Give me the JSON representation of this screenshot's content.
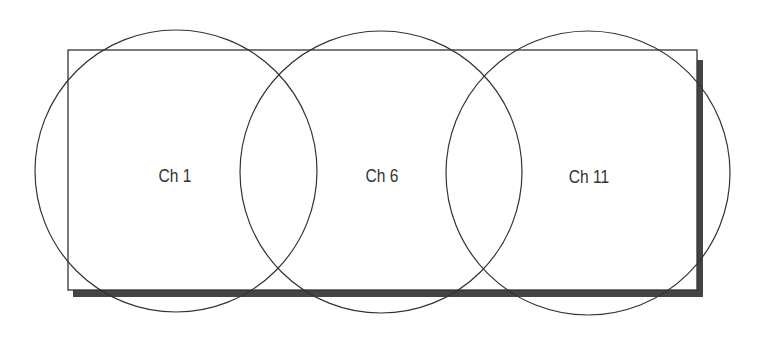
{
  "diagram": {
    "channels": [
      {
        "label": "Ch 1"
      },
      {
        "label": "Ch 6"
      },
      {
        "label": "Ch 11"
      }
    ],
    "colors": {
      "stroke": "#333333",
      "shadow": "#444444",
      "background": "#ffffff"
    }
  }
}
